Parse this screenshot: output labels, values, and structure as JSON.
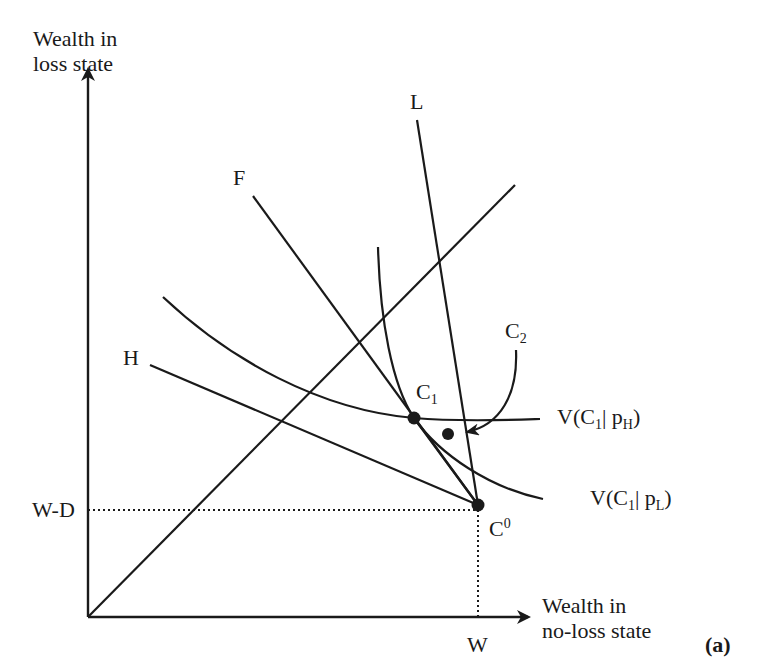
{
  "figure": {
    "panel_label": "(a)",
    "colors": {
      "ink": "#1a1a1a",
      "background": "#ffffff"
    }
  },
  "axes": {
    "y_label_line1": "Wealth in",
    "y_label_line2": "loss state",
    "x_label_line1": "Wealth in",
    "x_label_line2": "no-loss state",
    "x_tick": "W",
    "y_tick": "W-D",
    "origin": [
      88,
      617
    ],
    "y_top": [
      88,
      70
    ],
    "x_right": [
      528,
      617
    ]
  },
  "lines": {
    "certainty_line": {
      "from": [
        88,
        617
      ],
      "to": [
        515,
        185
      ]
    },
    "F": {
      "label": "F",
      "from": [
        253,
        196
      ],
      "to": [
        478,
        505
      ]
    },
    "L": {
      "label": "L",
      "from": [
        417,
        120
      ],
      "to": [
        478,
        505
      ]
    },
    "H": {
      "label": "H",
      "from": [
        150,
        365
      ],
      "to": [
        478,
        505
      ]
    },
    "dotted_h": {
      "from": [
        88,
        510
      ],
      "to": [
        478,
        510
      ]
    },
    "dotted_v": {
      "from": [
        478,
        510
      ],
      "to": [
        478,
        617
      ]
    }
  },
  "curves": {
    "V_pH": {
      "label_main": "V(C",
      "label_sub1": "1",
      "label_mid": "| p",
      "label_sub2": "H",
      "label_end": ")"
    },
    "V_pL": {
      "label_main": "V(C",
      "label_sub1": "1",
      "label_mid": "| p",
      "label_sub2": "L",
      "label_end": ")"
    }
  },
  "points": {
    "C1": {
      "label": "C",
      "sub": "1",
      "xy": [
        414,
        418
      ]
    },
    "C0": {
      "label": "C",
      "sup": "0",
      "xy": [
        478,
        505
      ]
    },
    "C2": {
      "label": "C",
      "sub": "2",
      "xy": [
        448,
        434
      ]
    }
  }
}
